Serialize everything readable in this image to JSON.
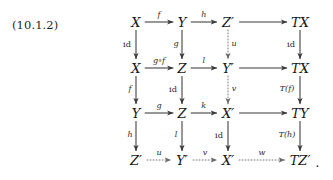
{
  "equation": {
    "number": "(10.1.2)"
  },
  "diagram": {
    "type": "commutative-diagram",
    "trailing_punctuation": ".",
    "columns_x": [
      136,
      182,
      228,
      300
    ],
    "rows_y": [
      22,
      68,
      113,
      160
    ],
    "nodes": [
      {
        "id": "r1c1",
        "label": "X",
        "row": 0,
        "col": 0
      },
      {
        "id": "r1c2",
        "label": "Y",
        "row": 0,
        "col": 1
      },
      {
        "id": "r1c3",
        "label": "Z′",
        "row": 0,
        "col": 2
      },
      {
        "id": "r1c4",
        "label": "TX",
        "row": 0,
        "col": 3
      },
      {
        "id": "r2c1",
        "label": "X",
        "row": 1,
        "col": 0
      },
      {
        "id": "r2c2",
        "label": "Z",
        "row": 1,
        "col": 1
      },
      {
        "id": "r2c3",
        "label": "Y′",
        "row": 1,
        "col": 2
      },
      {
        "id": "r2c4",
        "label": "TX",
        "row": 1,
        "col": 3
      },
      {
        "id": "r3c1",
        "label": "Y",
        "row": 2,
        "col": 0
      },
      {
        "id": "r3c2",
        "label": "Z",
        "row": 2,
        "col": 1
      },
      {
        "id": "r3c3",
        "label": "X′",
        "row": 2,
        "col": 2
      },
      {
        "id": "r3c4",
        "label": "TY",
        "row": 2,
        "col": 3
      },
      {
        "id": "r4c1",
        "label": "Z′",
        "row": 3,
        "col": 0
      },
      {
        "id": "r4c2",
        "label": "Y′",
        "row": 3,
        "col": 1
      },
      {
        "id": "r4c3",
        "label": "X′",
        "row": 3,
        "col": 2
      },
      {
        "id": "r4c4",
        "label": "TZ′",
        "row": 3,
        "col": 3
      }
    ],
    "horizontal_arrows": [
      {
        "id": "h-r1-c1c2",
        "label": "f",
        "style": "solid",
        "row": 0,
        "from": 0,
        "to": 1
      },
      {
        "id": "h-r1-c2c3",
        "label": "h",
        "style": "solid",
        "row": 0,
        "from": 1,
        "to": 2
      },
      {
        "id": "h-r1-c3c4",
        "label": "",
        "style": "solid",
        "row": 0,
        "from": 2,
        "to": 3
      },
      {
        "id": "h-r2-c1c2",
        "label": "g∘f",
        "style": "solid",
        "row": 1,
        "from": 0,
        "to": 1
      },
      {
        "id": "h-r2-c2c3",
        "label": "l",
        "style": "solid",
        "row": 1,
        "from": 1,
        "to": 2
      },
      {
        "id": "h-r2-c3c4",
        "label": "",
        "style": "solid",
        "row": 1,
        "from": 2,
        "to": 3
      },
      {
        "id": "h-r3-c1c2",
        "label": "g",
        "style": "solid",
        "row": 2,
        "from": 0,
        "to": 1
      },
      {
        "id": "h-r3-c2c3",
        "label": "k",
        "style": "solid",
        "row": 2,
        "from": 1,
        "to": 2
      },
      {
        "id": "h-r3-c3c4",
        "label": "",
        "style": "solid",
        "row": 2,
        "from": 2,
        "to": 3
      },
      {
        "id": "h-r4-c1c2",
        "label": "u",
        "style": "dotted",
        "row": 3,
        "from": 0,
        "to": 1
      },
      {
        "id": "h-r4-c2c3",
        "label": "v",
        "style": "dotted",
        "row": 3,
        "from": 1,
        "to": 2
      },
      {
        "id": "h-r4-c3c4",
        "label": "w",
        "style": "dotted",
        "row": 3,
        "from": 2,
        "to": 3
      }
    ],
    "vertical_arrows": [
      {
        "id": "v-c1-r1r2",
        "label": "id",
        "kind": "roman",
        "style": "solid",
        "col": 0,
        "from": 0,
        "to": 1,
        "side": "left"
      },
      {
        "id": "v-c1-r2r3",
        "label": "f",
        "kind": "italic",
        "style": "solid",
        "col": 0,
        "from": 1,
        "to": 2,
        "side": "left"
      },
      {
        "id": "v-c1-r3r4",
        "label": "h",
        "kind": "italic",
        "style": "solid",
        "col": 0,
        "from": 2,
        "to": 3,
        "side": "left"
      },
      {
        "id": "v-c2-r1r2",
        "label": "g",
        "kind": "italic",
        "style": "solid",
        "col": 1,
        "from": 0,
        "to": 1,
        "side": "left"
      },
      {
        "id": "v-c2-r2r3",
        "label": "id",
        "kind": "roman",
        "style": "solid",
        "col": 1,
        "from": 1,
        "to": 2,
        "side": "left"
      },
      {
        "id": "v-c2-r3r4",
        "label": "l",
        "kind": "italic",
        "style": "solid",
        "col": 1,
        "from": 2,
        "to": 3,
        "side": "left"
      },
      {
        "id": "v-c3-r1r2",
        "label": "u",
        "kind": "italic",
        "style": "dotted",
        "col": 2,
        "from": 0,
        "to": 1,
        "side": "right"
      },
      {
        "id": "v-c3-r2r3",
        "label": "v",
        "kind": "italic",
        "style": "dotted",
        "col": 2,
        "from": 1,
        "to": 2,
        "side": "right"
      },
      {
        "id": "v-c3-r3r4",
        "label": "id",
        "kind": "roman",
        "style": "solid",
        "col": 2,
        "from": 2,
        "to": 3,
        "side": "left"
      },
      {
        "id": "v-c4-r1r2",
        "label": "id",
        "kind": "roman",
        "style": "solid",
        "col": 3,
        "from": 0,
        "to": 1,
        "side": "left"
      },
      {
        "id": "v-c4-r2r3",
        "label": "T(f)",
        "kind": "italic",
        "style": "solid",
        "col": 3,
        "from": 1,
        "to": 2,
        "side": "left"
      },
      {
        "id": "v-c4-r3r4",
        "label": "T(h)",
        "kind": "italic",
        "style": "solid",
        "col": 3,
        "from": 2,
        "to": 3,
        "side": "left"
      }
    ],
    "colors": {
      "ink": "#161616",
      "arrow": "#3a3a3a",
      "background": "#ffffff"
    }
  }
}
